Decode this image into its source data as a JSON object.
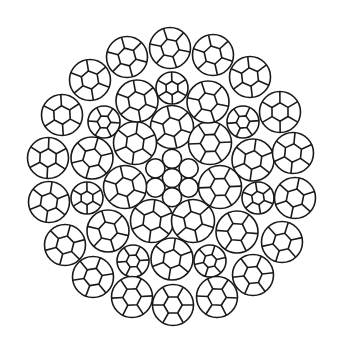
{
  "diagram": {
    "line_color": "#1a1a1a",
    "background_color": "#ffffff",
    "core": {
      "type": "independent wire core",
      "wire_count": 7,
      "arrangement": "1+6"
    },
    "strand_layers": [
      {
        "name": "inner",
        "strand_count": 7,
        "strand_type": "large"
      },
      {
        "name": "middle",
        "strand_count": 14,
        "strand_types": [
          "small",
          "large",
          "large",
          "small",
          "small",
          "large",
          "large",
          "small",
          "small",
          "large",
          "large",
          "small",
          "small",
          "large"
        ]
      },
      {
        "name": "outer",
        "strand_count": 18,
        "strand_type": "large"
      }
    ],
    "total_strands": 39
  }
}
